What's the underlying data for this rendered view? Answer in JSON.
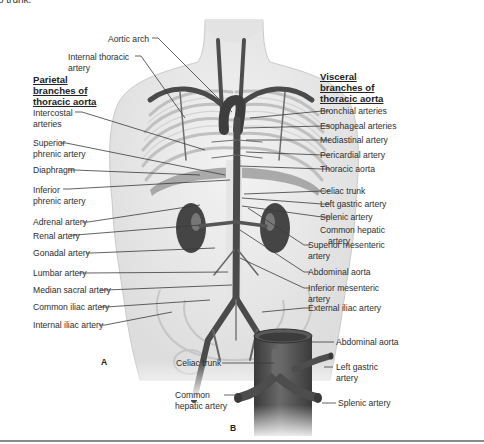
{
  "top_fragment": "o trunk.",
  "parietal": {
    "heading": [
      "Parietal",
      "branches of",
      "thoracic aorta"
    ],
    "labels": {
      "aortic_arch": "Aortic arch",
      "internal_thoracic": [
        "Internal thoracic",
        "artery"
      ],
      "intercostal": [
        "Intercostal",
        "arteries"
      ],
      "superior_phrenic": [
        "Superior",
        "phrenic artery"
      ],
      "diaphragm": "Diaphragm",
      "inferior_phrenic": [
        "Inferior",
        "phrenic artery"
      ],
      "adrenal": "Adrenal artery",
      "renal": "Renal artery",
      "gonadal": "Gonadal artery",
      "lumbar": "Lumbar artery",
      "median_sacral": "Median sacral artery",
      "common_iliac": "Common iliac artery",
      "internal_iliac": "Internal iliac artery"
    }
  },
  "visceral": {
    "heading": [
      "Visceral",
      "branches of",
      "thoracic aorta"
    ],
    "labels": {
      "bronchial": "Bronchial arteries",
      "esophageal": "Esophageal arteries",
      "mediastinal": "Mediastinal artery",
      "pericardial": "Pericardial artery",
      "thoracic_aorta": "Thoracic aorta",
      "celiac": "Celiac trunk",
      "left_gastric": "Left gastric artery",
      "splenic": "Splenic artery",
      "common_hepatic": [
        "Common hepatic",
        "artery"
      ],
      "superior_mesenteric": [
        "Superior mesenteric",
        "artery"
      ],
      "abdominal_aorta": "Abdominal aorta",
      "inferior_mesenteric": [
        "Inferior mesenteric",
        "artery"
      ],
      "external_iliac": "External iliac artery"
    }
  },
  "inset": {
    "panel_label": "B",
    "abdominal_aorta": "Abdominal aorta",
    "celiac": "Celiac trunk",
    "left_gastric": [
      "Left gastric",
      "artery"
    ],
    "common_hepatic": [
      "Common",
      "hepatic artery"
    ],
    "splenic": "Splenic artery"
  },
  "panel_a": "A",
  "colors": {
    "artery": "#5a5a5a",
    "artery_dark": "#3c3c3c",
    "body": "#ececec",
    "leader": "#3a3a3a"
  }
}
